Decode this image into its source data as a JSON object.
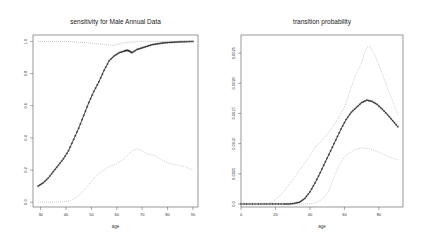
{
  "chart_data": [
    {
      "type": "line",
      "title": "sensitivity for Male Annual Data",
      "xlabel": "age",
      "ylabel": "",
      "xlim": [
        27,
        92
      ],
      "ylim": [
        -0.03,
        1.04
      ],
      "xticks": [
        30,
        40,
        50,
        60,
        70,
        80,
        90
      ],
      "xtick_labels": [
        "30",
        "40",
        "50",
        "60",
        "70",
        "80",
        "90"
      ],
      "yticks": [
        0.0,
        0.2,
        0.4,
        0.6,
        0.8,
        1.0
      ],
      "ytick_labels": [
        "0.0",
        "0.2",
        "0.4",
        "0.6",
        "0.8",
        "1.0"
      ],
      "grid": false,
      "series": [
        {
          "name": "estimate",
          "style": "line-with-plus-markers",
          "color": "#333333",
          "x": [
            29,
            31,
            33,
            35,
            37,
            39,
            41,
            43,
            45,
            47,
            49,
            51,
            53,
            55,
            57,
            59,
            61,
            63,
            64,
            65,
            66,
            68,
            70,
            72,
            74,
            76,
            78,
            80,
            82,
            84,
            86,
            88,
            90
          ],
          "y": [
            0.1,
            0.12,
            0.15,
            0.19,
            0.23,
            0.27,
            0.32,
            0.39,
            0.46,
            0.54,
            0.62,
            0.69,
            0.75,
            0.82,
            0.88,
            0.91,
            0.93,
            0.94,
            0.945,
            0.94,
            0.93,
            0.95,
            0.96,
            0.97,
            0.98,
            0.985,
            0.99,
            0.993,
            0.995,
            0.997,
            0.998,
            0.999,
            1.0
          ]
        },
        {
          "name": "upper bound",
          "style": "dotted",
          "color": "#999999",
          "x": [
            29,
            35,
            40,
            45,
            50,
            55,
            58,
            60,
            62,
            65,
            70,
            75,
            80,
            85,
            90
          ],
          "y": [
            1.0,
            1.0,
            1.0,
            0.995,
            0.99,
            0.98,
            0.975,
            0.98,
            0.99,
            0.995,
            1.0,
            1.0,
            1.0,
            1.0,
            1.0
          ]
        },
        {
          "name": "lower bound",
          "style": "dotted",
          "color": "#aaaaaa",
          "x": [
            29,
            35,
            40,
            42,
            45,
            48,
            51,
            54,
            57,
            60,
            63,
            66,
            68,
            70,
            72,
            75,
            78,
            81,
            84,
            87,
            90
          ],
          "y": [
            0.0,
            0.0,
            0.005,
            0.01,
            0.04,
            0.09,
            0.15,
            0.19,
            0.22,
            0.24,
            0.27,
            0.32,
            0.33,
            0.32,
            0.3,
            0.29,
            0.26,
            0.24,
            0.23,
            0.22,
            0.2
          ]
        }
      ]
    },
    {
      "type": "line",
      "title": "transition probability",
      "xlabel": "age",
      "ylabel": "",
      "xlim": [
        0,
        94
      ],
      "ylim": [
        -5e-05,
        0.0028
      ],
      "xticks": [
        0,
        20,
        40,
        60,
        80
      ],
      "xtick_labels": [
        "0",
        "20",
        "40",
        "60",
        "80"
      ],
      "yticks": [
        0.0,
        0.0005,
        0.001,
        0.0015,
        0.002,
        0.0025
      ],
      "ytick_labels": [
        "0.0",
        "0.0005",
        "0.0010",
        "0.0015",
        "0.0020",
        "0.0025"
      ],
      "grid": false,
      "series": [
        {
          "name": "estimate",
          "style": "line-with-plus-markers",
          "color": "#333333",
          "x": [
            0,
            5,
            10,
            15,
            20,
            25,
            28,
            31,
            34,
            37,
            40,
            43,
            46,
            49,
            52,
            55,
            58,
            61,
            64,
            67,
            70,
            73,
            76,
            79,
            82,
            85,
            88,
            91
          ],
          "y": [
            0.0,
            0.0,
            0.0,
            0.0,
            0.0,
            0.0,
            0.0,
            1e-05,
            3e-05,
            9e-05,
            0.0002,
            0.00035,
            0.00052,
            0.0007,
            0.00088,
            0.00106,
            0.00124,
            0.0014,
            0.00152,
            0.0016,
            0.00168,
            0.00172,
            0.0017,
            0.00165,
            0.00157,
            0.00148,
            0.00138,
            0.00128
          ]
        },
        {
          "name": "upper bound",
          "style": "dotted",
          "color": "#aaaaaa",
          "x": [
            0,
            10,
            15,
            18,
            22,
            26,
            30,
            35,
            40,
            43,
            46,
            50,
            55,
            60,
            63,
            66,
            70,
            73,
            75,
            78,
            82,
            86,
            91
          ],
          "y": [
            0.0,
            0.0,
            0.0,
            3e-05,
            0.00012,
            0.00025,
            0.0004,
            0.0006,
            0.0008,
            0.00095,
            0.00102,
            0.00115,
            0.00135,
            0.0016,
            0.00185,
            0.0021,
            0.00235,
            0.0026,
            0.0026,
            0.00245,
            0.00215,
            0.00185,
            0.00148
          ]
        },
        {
          "name": "lower bound",
          "style": "dotted",
          "color": "#aaaaaa",
          "x": [
            0,
            10,
            20,
            30,
            38,
            42,
            45,
            48,
            51,
            54,
            57,
            60,
            63,
            66,
            70,
            74,
            78,
            82,
            86,
            91
          ],
          "y": [
            0.0,
            0.0,
            0.0,
            0.0,
            0.0,
            1e-05,
            4e-05,
            0.0001,
            0.00022,
            0.00045,
            0.00065,
            0.00078,
            0.00085,
            0.0009,
            0.00093,
            0.00092,
            0.00088,
            0.00083,
            0.00078,
            0.00073
          ]
        }
      ]
    }
  ]
}
